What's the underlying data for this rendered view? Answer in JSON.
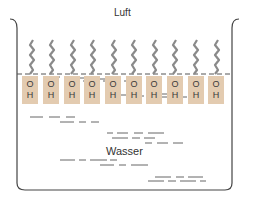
{
  "labels": {
    "air": "Luft",
    "water": "Wasser"
  },
  "colors": {
    "molecule_fill": "#e3cbb0",
    "tail": "#8a8a8a",
    "tank": "#444444",
    "water_dash": "#555555"
  },
  "molecules": [
    {
      "o": "O",
      "h": "H"
    },
    {
      "o": "O",
      "h": "H"
    },
    {
      "o": "O",
      "h": "H"
    },
    {
      "o": "O",
      "h": "H"
    },
    {
      "o": "O",
      "h": "H"
    },
    {
      "o": "O",
      "h": "H"
    },
    {
      "o": "O",
      "h": "H"
    },
    {
      "o": "O",
      "h": "H"
    },
    {
      "o": "O",
      "h": "H"
    },
    {
      "o": "O",
      "h": "H"
    }
  ]
}
